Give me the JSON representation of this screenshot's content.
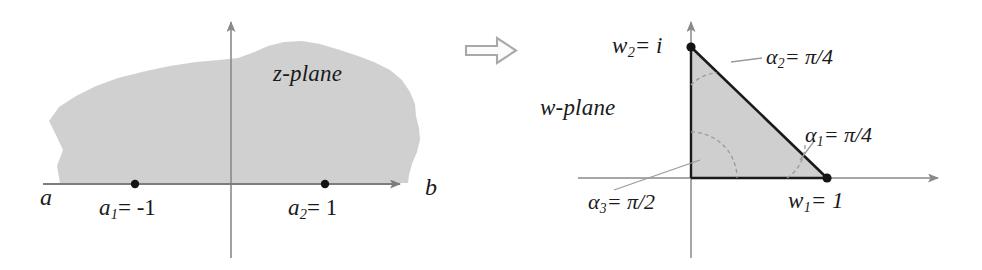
{
  "figure": {
    "background_color": "#ffffff",
    "region_fill": "#cccccc",
    "axis_color": "#7d7d7d",
    "ink_color": "#1a1a1a",
    "arrow_color": "#b0b0b0"
  },
  "left_panel": {
    "plane_label": "z-plane",
    "axis_left_letter": "a",
    "axis_right_letter": "b",
    "points": [
      {
        "name": "a1",
        "label_base": "a",
        "label_sub": "1",
        "label_rest": "= -1",
        "value": -1
      },
      {
        "name": "a2",
        "label_base": "a",
        "label_sub": "2",
        "label_rest": "= 1",
        "value": 1
      }
    ]
  },
  "transform_arrow": {
    "icon": "right-block-arrow-icon",
    "direction": "right"
  },
  "right_panel": {
    "plane_label": "w-plane",
    "vertices": [
      {
        "name": "w1",
        "label_base": "w",
        "label_sub": "1",
        "label_rest": "= 1",
        "value": "1"
      },
      {
        "name": "w2",
        "label_base": "w",
        "label_sub": "2",
        "label_rest": "= i",
        "value": "i"
      }
    ],
    "angles": [
      {
        "name": "alpha1",
        "label_base": "α",
        "label_sub": "1",
        "label_rest": "= π/4",
        "value": "π/4"
      },
      {
        "name": "alpha2",
        "label_base": "α",
        "label_sub": "2",
        "label_rest": "= π/4",
        "value": "π/4"
      },
      {
        "name": "alpha3",
        "label_base": "α",
        "label_sub": "3",
        "label_rest": "= π/2",
        "value": "π/2"
      }
    ]
  }
}
